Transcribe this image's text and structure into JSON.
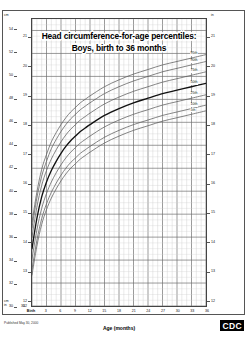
{
  "title": {
    "line1": "Head circumference-for-age percentiles:",
    "line2": "Boys, birth to 36 months"
  },
  "footer": {
    "published": "Published May 30, 2000",
    "logo": "CDC"
  },
  "axes": {
    "x_title": "Age (months)",
    "x_ticks": [
      "Birth",
      "3",
      "6",
      "9",
      "12",
      "15",
      "18",
      "21",
      "24",
      "27",
      "30",
      "33",
      "36"
    ],
    "left_outer_unit": "cm",
    "left_inner_unit": "in",
    "right_unit": "in",
    "left_cm_ticks": [
      "54",
      "52",
      "50",
      "48",
      "46",
      "44",
      "42",
      "40",
      "38",
      "36",
      "34",
      "32",
      "30"
    ],
    "left_in_ticks": [
      "21",
      "20",
      "19",
      "18",
      "17",
      "16",
      "15",
      "14",
      "13",
      "12"
    ],
    "right_in_ticks": [
      "21",
      "20",
      "19",
      "18",
      "17",
      "16",
      "15",
      "14",
      "13",
      "12"
    ],
    "bottom_cm_tick": "30",
    "bottom_in_tick": "12"
  },
  "chart_data": {
    "type": "line",
    "title": "Head circumference-for-age percentiles: Boys, birth to 36 months",
    "xlabel": "Age (months)",
    "ylabel": "Head circumference (cm / in)",
    "xlim": [
      0,
      36
    ],
    "ylim": [
      30,
      55
    ],
    "xlim_right_in": [
      12,
      22
    ],
    "grid": true,
    "legend": "right-inline",
    "x": [
      0,
      1,
      2,
      3,
      4,
      5,
      6,
      7,
      8,
      9,
      10,
      11,
      12,
      15,
      18,
      21,
      24,
      27,
      30,
      33,
      36
    ],
    "series": [
      {
        "name": "95th",
        "label": "95th",
        "color": "#5a5a5a",
        "width": 0.75,
        "values": [
          37.3,
          39.9,
          41.9,
          43.2,
          44.3,
          45.1,
          45.8,
          46.4,
          46.9,
          47.3,
          47.7,
          48.0,
          48.3,
          49.1,
          49.7,
          50.2,
          50.6,
          51.0,
          51.3,
          51.6,
          51.9
        ]
      },
      {
        "name": "90th",
        "label": "90th",
        "color": "#5a5a5a",
        "width": 0.75,
        "values": [
          36.8,
          39.4,
          41.3,
          42.6,
          43.7,
          44.5,
          45.2,
          45.8,
          46.3,
          46.7,
          47.1,
          47.4,
          47.7,
          48.5,
          49.1,
          49.6,
          50.0,
          50.4,
          50.7,
          51.0,
          51.3
        ]
      },
      {
        "name": "75th",
        "label": "75th",
        "color": "#5a5a5a",
        "width": 0.75,
        "values": [
          36.0,
          38.6,
          40.5,
          41.8,
          42.8,
          43.6,
          44.3,
          44.9,
          45.4,
          45.8,
          46.2,
          46.5,
          46.8,
          47.6,
          48.2,
          48.7,
          49.1,
          49.5,
          49.8,
          50.1,
          50.4
        ]
      },
      {
        "name": "50th",
        "label": "50th",
        "color": "#111111",
        "width": 1.35,
        "values": [
          35.0,
          37.6,
          39.5,
          40.8,
          41.8,
          42.6,
          43.3,
          43.9,
          44.4,
          44.8,
          45.2,
          45.5,
          45.8,
          46.6,
          47.2,
          47.7,
          48.1,
          48.5,
          48.8,
          49.1,
          49.4
        ]
      },
      {
        "name": "25th",
        "label": "25th",
        "color": "#5a5a5a",
        "width": 0.75,
        "values": [
          34.1,
          36.6,
          38.5,
          39.8,
          40.8,
          41.6,
          42.3,
          42.9,
          43.4,
          43.8,
          44.2,
          44.5,
          44.8,
          45.6,
          46.2,
          46.7,
          47.1,
          47.5,
          47.8,
          48.1,
          48.4
        ]
      },
      {
        "name": "10th",
        "label": "10th",
        "color": "#5a5a5a",
        "width": 0.75,
        "values": [
          33.2,
          35.7,
          37.6,
          38.9,
          39.9,
          40.7,
          41.4,
          42.0,
          42.5,
          42.9,
          43.3,
          43.6,
          43.9,
          44.7,
          45.3,
          45.8,
          46.2,
          46.6,
          46.9,
          47.2,
          47.5
        ]
      },
      {
        "name": "5th",
        "label": "5th",
        "color": "#5a5a5a",
        "width": 0.75,
        "values": [
          32.7,
          35.2,
          37.1,
          38.4,
          39.4,
          40.2,
          40.9,
          41.5,
          42.0,
          42.4,
          42.8,
          43.1,
          43.4,
          44.2,
          44.8,
          45.3,
          45.7,
          46.1,
          46.4,
          46.7,
          47.0
        ]
      }
    ]
  }
}
